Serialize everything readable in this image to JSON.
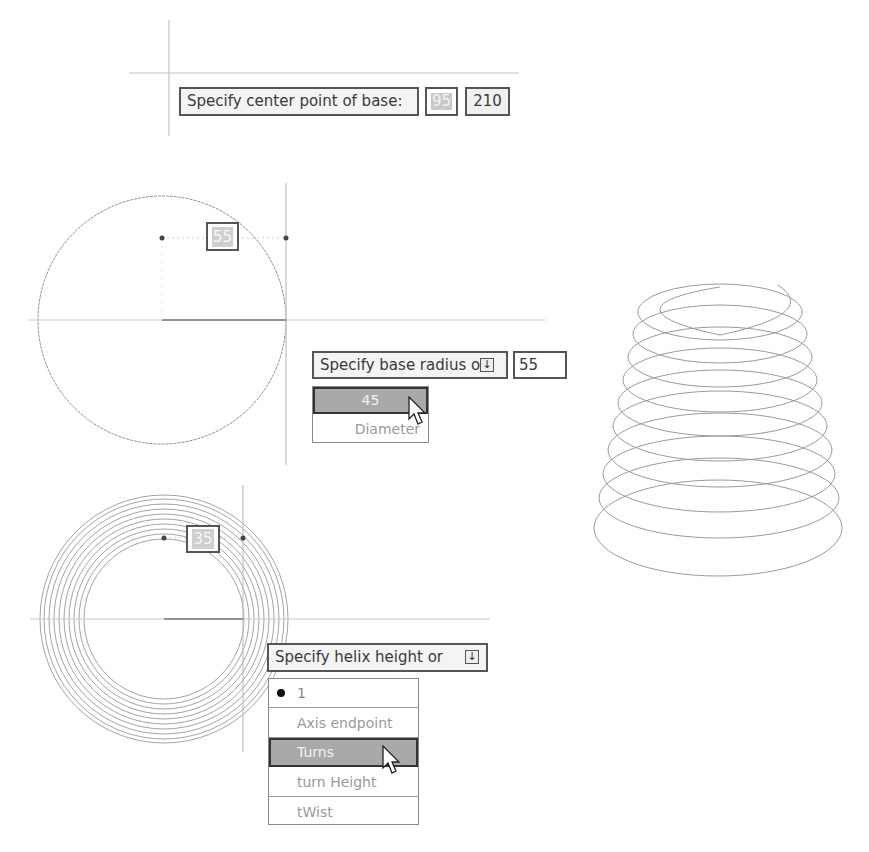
{
  "step1": {
    "prompt": "Specify center point of base:",
    "x_value": "95",
    "y_value": "210"
  },
  "step2": {
    "inline_radius": "55",
    "prompt": "Specify base radius or",
    "dropdown_icon": "down-arrow-icon",
    "value": "55",
    "options": [
      {
        "label": "45",
        "highlighted": true
      },
      {
        "label": "Diameter",
        "highlighted": false
      }
    ]
  },
  "step3": {
    "inline_radius": "35",
    "prompt": "Specify helix height or",
    "dropdown_icon": "down-arrow-icon",
    "options": [
      {
        "label": "1",
        "bullet": true,
        "highlighted": false
      },
      {
        "label": "Axis endpoint",
        "highlighted": false
      },
      {
        "label": "Turns",
        "highlighted": true
      },
      {
        "label": "turn Height",
        "highlighted": false
      },
      {
        "label": "tWist",
        "highlighted": false
      }
    ]
  },
  "colors": {
    "line": "#b0b0b0",
    "curve": "#8a8a8a",
    "highlight": "#a9a9a9",
    "border": "#555555"
  }
}
